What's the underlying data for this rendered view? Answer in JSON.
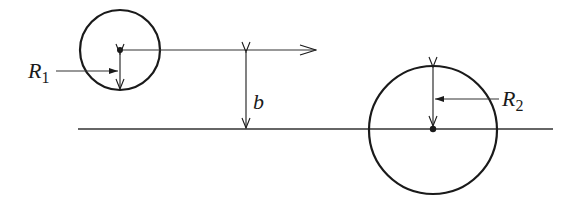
{
  "diagram": {
    "type": "geometry-scattering",
    "stroke_color": "#1a1a1a",
    "baseline": {
      "x1": 78,
      "x2": 553,
      "y": 129
    },
    "small_circle": {
      "cx": 120,
      "cy": 50,
      "r": 40
    },
    "large_circle": {
      "cx": 433,
      "cy": 130,
      "r": 64
    },
    "velocity_arrow": {
      "x1": 120,
      "x2": 316,
      "y": 50
    },
    "impact_parameter_arrow": {
      "x": 246,
      "y1": 51,
      "y2": 129
    },
    "r1_arrow": {
      "x": 120,
      "y1": 53,
      "y2": 90
    },
    "r2_arrow": {
      "x": 433,
      "y1": 67,
      "y2": 127
    }
  },
  "labels": {
    "r1": {
      "main": "R",
      "sub": "1"
    },
    "r2": {
      "main": "R",
      "sub": "2"
    },
    "b": "b"
  }
}
